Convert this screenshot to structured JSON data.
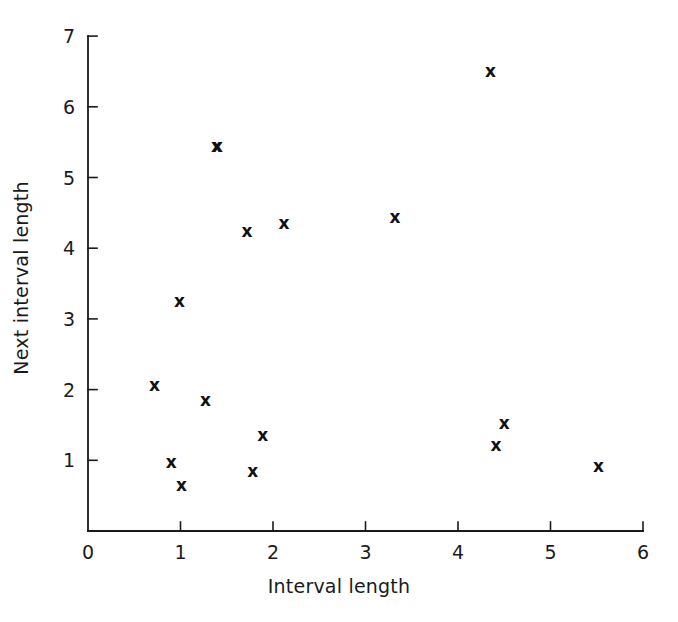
{
  "chart_data": {
    "type": "scatter",
    "title": "",
    "xlabel": "Interval length",
    "ylabel": "Next interval length",
    "xlim": [
      0,
      6
    ],
    "ylim": [
      0,
      7
    ],
    "xticks": [
      0,
      1,
      2,
      3,
      4,
      5,
      6
    ],
    "yticks": [
      1,
      2,
      3,
      4,
      5,
      6,
      7
    ],
    "xtick_labels": [
      "0",
      "1",
      "2",
      "3",
      "4",
      "5",
      "6"
    ],
    "ytick_labels": [
      "1",
      "2",
      "3",
      "4",
      "5",
      "6",
      "7"
    ],
    "grid": false,
    "legend": null,
    "marker": "x",
    "marker_color": "#111111",
    "axis_color": "#1a1a1a",
    "background": "#ffffff",
    "n_points": 16,
    "points": [
      {
        "x": 0.72,
        "y": 2.07
      },
      {
        "x": 0.9,
        "y": 0.97
      },
      {
        "x": 0.99,
        "y": 3.25
      },
      {
        "x": 1.01,
        "y": 0.65
      },
      {
        "x": 1.27,
        "y": 1.85
      },
      {
        "x": 1.39,
        "y": 5.45
      },
      {
        "x": 1.72,
        "y": 4.25
      },
      {
        "x": 1.78,
        "y": 0.85
      },
      {
        "x": 1.89,
        "y": 1.36
      },
      {
        "x": 2.12,
        "y": 4.35
      },
      {
        "x": 3.32,
        "y": 4.44
      },
      {
        "x": 4.35,
        "y": 6.5
      },
      {
        "x": 4.41,
        "y": 1.22
      },
      {
        "x": 4.5,
        "y": 1.53
      },
      {
        "x": 5.52,
        "y": 0.92
      },
      {
        "x": 1.4,
        "y": 5.45
      }
    ]
  }
}
